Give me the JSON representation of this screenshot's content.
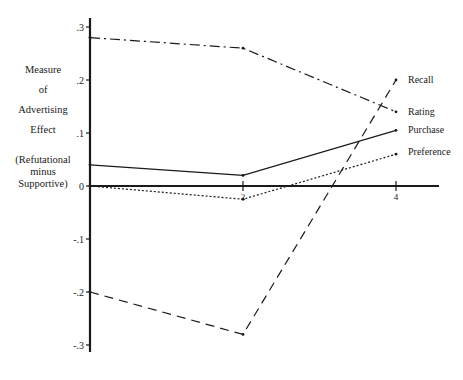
{
  "chart_data": {
    "type": "line",
    "title": "",
    "xlabel": "",
    "ylabel": "Measure of Advertising Effect (Refutational minus Supportive)",
    "ylabel_lines": [
      "Measure",
      "of",
      "Advertising",
      "Effect"
    ],
    "ylabel_sub_lines": [
      "(Refutational",
      "minus",
      "Supportive)"
    ],
    "x": [
      0,
      2,
      4
    ],
    "x_ticks": [
      {
        "value": 2,
        "label": "2"
      },
      {
        "value": 4,
        "label": "4"
      }
    ],
    "y_ticks": [
      {
        "value": 0.3,
        "label": ".3"
      },
      {
        "value": 0.2,
        "label": ".2"
      },
      {
        "value": 0.1,
        "label": ".1"
      },
      {
        "value": 0,
        "label": "0"
      },
      {
        "value": -0.1,
        "label": "-.1"
      },
      {
        "value": -0.2,
        "label": "-.2"
      },
      {
        "value": -0.3,
        "label": "-.3"
      }
    ],
    "ylim": [
      -0.33,
      0.32
    ],
    "xlim": [
      0,
      4.56
    ],
    "grid": false,
    "legend_position": "inline-right",
    "series": [
      {
        "name": "Recall",
        "values": [
          -0.2,
          -0.28,
          0.2
        ],
        "dash": "9,6",
        "label_y_offset": 0
      },
      {
        "name": "Rating",
        "values": [
          0.28,
          0.26,
          0.14
        ],
        "dash": "10,4,2,4",
        "label_y_offset": 0
      },
      {
        "name": "Purchase",
        "values": [
          0.04,
          0.02,
          0.105
        ],
        "dash": "",
        "label_y_offset": 0
      },
      {
        "name": "Preference",
        "values": [
          0.0,
          -0.025,
          0.06
        ],
        "dash": "2,2",
        "label_y_offset": 0
      }
    ]
  },
  "colors": {
    "ink": "#1a1a1a",
    "background": "#ffffff"
  }
}
